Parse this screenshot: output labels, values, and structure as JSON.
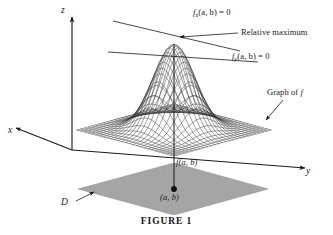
{
  "figure": {
    "caption": "FIGURE 1",
    "background_color": "#ffffff",
    "ink_color": "#1a1a1a"
  },
  "axes": {
    "z_label": "z",
    "x_label": "x",
    "y_label": "y"
  },
  "annotations": {
    "fx_label_prefix": "f",
    "fx_label_sub": "x",
    "fx_label_suffix": "(a, b) = 0",
    "fy_label_prefix": "f",
    "fy_label_sub": "y",
    "fy_label_suffix": "(a, b) = 0",
    "relative_maximum": "Relative maximum",
    "graph_of_prefix": "Graph of ",
    "graph_of_f": "f",
    "f_of_ab": "f(a, b)",
    "point_ab": "(a, b)",
    "domain_label": "D"
  },
  "chart_data": {
    "type": "surface",
    "title": "FIGURE 1",
    "function": "z = exp(-(u^2 + v^2))",
    "peak": {
      "x": "a",
      "y": "b",
      "z": "f(a, b)"
    },
    "surface_color": "#3a3a3a",
    "domain_fill_color": "#a3a3a3",
    "mesh_divisions": 26,
    "domain_extent": [
      -2.6,
      2.6
    ],
    "zlim": [
      0,
      1
    ],
    "grid": true,
    "legend": "none"
  }
}
